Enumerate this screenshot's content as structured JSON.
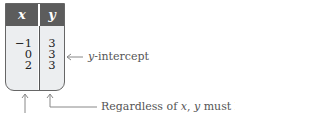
{
  "table": {
    "headers": [
      "x",
      "y"
    ],
    "rows": [
      {
        "x": "−1",
        "y": "3"
      },
      {
        "x": "0",
        "y": "3"
      },
      {
        "x": "2",
        "y": "3"
      }
    ]
  },
  "annotations": {
    "y_intercept": {
      "var": "y",
      "text": "-intercept"
    },
    "regardless": {
      "prefix": "Regardless of ",
      "x": "x",
      "middle": ", ",
      "y": "y",
      "suffix": " must be 3."
    }
  },
  "colors": {
    "header_bg": "#5c5c5c",
    "cell_bg": "#eceef0",
    "arrow": "#888888"
  }
}
